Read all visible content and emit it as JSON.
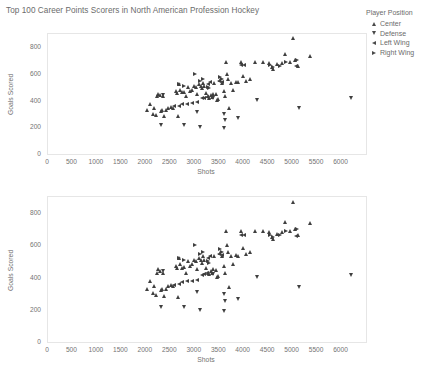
{
  "title": "Top 100 Career Points Scorers in North American Profession Hockey",
  "legend": {
    "title": "Player Position",
    "items": [
      {
        "label": "Center",
        "marker": "triangle-up-icon",
        "shape": "up"
      },
      {
        "label": "Defense",
        "marker": "triangle-down-icon",
        "shape": "down"
      },
      {
        "label": "Left Wing",
        "marker": "triangle-left-icon",
        "shape": "left"
      },
      {
        "label": "Right Wing",
        "marker": "triangle-right-icon",
        "shape": "right"
      }
    ]
  },
  "colors": {
    "marker": "#3f3f3f",
    "axis_text": "#737373",
    "frame": "#e6e6e6",
    "title_text": "#6b6b6b"
  },
  "chart_data": [
    {
      "type": "scatter",
      "title": "Top 100 Career Points Scorers in North American Profession Hockey",
      "xlabel": "Shots",
      "ylabel": "Goals Scored",
      "xlim": [
        0,
        6500
      ],
      "ylim": [
        0,
        900
      ],
      "xticks": [
        0,
        500,
        1000,
        1500,
        2000,
        2500,
        3000,
        3500,
        4000,
        4500,
        5000,
        5500,
        6000
      ],
      "yticks": [
        0,
        200,
        400,
        600,
        800
      ],
      "grid": false,
      "legend_position": "right",
      "series": [
        {
          "name": "Center",
          "marker": "triangle-up",
          "points": [
            [
              2030,
              325
            ],
            [
              2090,
              375
            ],
            [
              2150,
              300
            ],
            [
              2180,
              345
            ],
            [
              2210,
              290
            ],
            [
              2250,
              430
            ],
            [
              2270,
              450
            ],
            [
              2300,
              440
            ],
            [
              2330,
              320
            ],
            [
              2340,
              330
            ],
            [
              2360,
              430
            ],
            [
              2380,
              285
            ],
            [
              2420,
              325
            ],
            [
              2470,
              345
            ],
            [
              2520,
              350
            ],
            [
              2560,
              345
            ],
            [
              2620,
              470
            ],
            [
              2640,
              455
            ],
            [
              2660,
              280
            ],
            [
              2700,
              520
            ],
            [
              2720,
              480
            ],
            [
              2760,
              460
            ],
            [
              2800,
              465
            ],
            [
              2840,
              430
            ],
            [
              2880,
              500
            ],
            [
              2920,
              470
            ],
            [
              2960,
              480
            ],
            [
              3000,
              510
            ],
            [
              3040,
              500
            ],
            [
              3060,
              450
            ],
            [
              3100,
              520
            ],
            [
              3130,
              505
            ],
            [
              3160,
              490
            ],
            [
              3180,
              530
            ],
            [
              3200,
              510
            ],
            [
              3240,
              455
            ],
            [
              3280,
              430
            ],
            [
              3300,
              420
            ],
            [
              3340,
              440
            ],
            [
              3360,
              425
            ],
            [
              3380,
              450
            ],
            [
              3400,
              530
            ],
            [
              3440,
              445
            ],
            [
              3470,
              400
            ],
            [
              3490,
              410
            ],
            [
              3520,
              550
            ],
            [
              3560,
              530
            ],
            [
              3600,
              470
            ],
            [
              3620,
              430
            ],
            [
              3650,
              690
            ],
            [
              3680,
              600
            ],
            [
              3700,
              560
            ],
            [
              3720,
              340
            ],
            [
              3760,
              530
            ],
            [
              3800,
              480
            ],
            [
              3860,
              540
            ],
            [
              3900,
              535
            ],
            [
              3960,
              690
            ],
            [
              4000,
              580
            ],
            [
              4050,
              545
            ],
            [
              4150,
              560
            ],
            [
              4250,
              690
            ],
            [
              4400,
              690
            ],
            [
              4520,
              680
            ],
            [
              4600,
              650
            ],
            [
              4620,
              635
            ],
            [
              4700,
              670
            ],
            [
              4800,
              680
            ],
            [
              4860,
              745
            ],
            [
              4950,
              690
            ],
            [
              5020,
              870
            ],
            [
              5060,
              700
            ],
            [
              5120,
              660
            ],
            [
              5360,
              735
            ]
          ]
        },
        {
          "name": "Defense",
          "marker": "triangle-down",
          "points": [
            [
              2330,
              215
            ],
            [
              2360,
              440
            ],
            [
              2800,
              215
            ],
            [
              3060,
              310
            ],
            [
              3120,
              200
            ],
            [
              3380,
              420
            ],
            [
              3600,
              190
            ],
            [
              3610,
              295
            ],
            [
              3630,
              255
            ],
            [
              3900,
              265
            ],
            [
              4280,
              400
            ],
            [
              5150,
              340
            ],
            [
              6200,
              415
            ]
          ]
        },
        {
          "name": "Left Wing",
          "marker": "triangle-left",
          "points": [
            [
              2580,
              355
            ],
            [
              2680,
              360
            ],
            [
              2760,
              370
            ],
            [
              2860,
              375
            ],
            [
              2960,
              380
            ],
            [
              3060,
              385
            ],
            [
              3160,
              415
            ],
            [
              3200,
              420
            ],
            [
              3260,
              425
            ],
            [
              3280,
              520
            ],
            [
              3320,
              535
            ],
            [
              3500,
              545
            ],
            [
              3560,
              540
            ],
            [
              3960,
              665
            ],
            [
              4010,
              665
            ],
            [
              5080,
              655
            ]
          ]
        },
        {
          "name": "Right Wing",
          "marker": "triangle-right",
          "points": [
            [
              2680,
              520
            ],
            [
              2800,
              510
            ],
            [
              3010,
              600
            ],
            [
              3120,
              545
            ],
            [
              3180,
              560
            ],
            [
              3280,
              500
            ],
            [
              3300,
              490
            ],
            [
              3520,
              575
            ],
            [
              3560,
              560
            ],
            [
              4560,
              665
            ],
            [
              4620,
              650
            ],
            [
              4760,
              660
            ],
            [
              4880,
              690
            ],
            [
              5100,
              700
            ]
          ]
        }
      ]
    },
    {
      "type": "scatter",
      "title": "",
      "xlabel": "Shots",
      "ylabel": "Goals Scored",
      "xlim": [
        0,
        6500
      ],
      "ylim": [
        0,
        900
      ],
      "xticks": [
        0,
        500,
        1000,
        1500,
        2000,
        2500,
        3000,
        3500,
        4000,
        4500,
        5000,
        5500,
        6000
      ],
      "yticks": [
        0,
        200,
        400,
        600,
        800
      ],
      "grid": false,
      "legend_position": "none",
      "series": [
        {
          "name": "Center",
          "marker": "triangle-up",
          "points": [
            [
              2030,
              325
            ],
            [
              2090,
              375
            ],
            [
              2150,
              300
            ],
            [
              2180,
              345
            ],
            [
              2210,
              290
            ],
            [
              2250,
              430
            ],
            [
              2270,
              450
            ],
            [
              2300,
              440
            ],
            [
              2330,
              320
            ],
            [
              2340,
              330
            ],
            [
              2360,
              430
            ],
            [
              2380,
              285
            ],
            [
              2420,
              325
            ],
            [
              2470,
              345
            ],
            [
              2520,
              350
            ],
            [
              2560,
              345
            ],
            [
              2620,
              470
            ],
            [
              2640,
              455
            ],
            [
              2660,
              280
            ],
            [
              2700,
              520
            ],
            [
              2720,
              480
            ],
            [
              2760,
              460
            ],
            [
              2800,
              465
            ],
            [
              2840,
              430
            ],
            [
              2880,
              500
            ],
            [
              2920,
              470
            ],
            [
              2960,
              480
            ],
            [
              3000,
              510
            ],
            [
              3040,
              500
            ],
            [
              3060,
              450
            ],
            [
              3100,
              520
            ],
            [
              3130,
              505
            ],
            [
              3160,
              490
            ],
            [
              3180,
              530
            ],
            [
              3200,
              510
            ],
            [
              3240,
              455
            ],
            [
              3280,
              430
            ],
            [
              3300,
              420
            ],
            [
              3340,
              440
            ],
            [
              3360,
              425
            ],
            [
              3380,
              450
            ],
            [
              3400,
              530
            ],
            [
              3440,
              445
            ],
            [
              3470,
              400
            ],
            [
              3490,
              410
            ],
            [
              3520,
              550
            ],
            [
              3560,
              530
            ],
            [
              3600,
              470
            ],
            [
              3620,
              430
            ],
            [
              3650,
              690
            ],
            [
              3680,
              600
            ],
            [
              3700,
              560
            ],
            [
              3720,
              340
            ],
            [
              3760,
              530
            ],
            [
              3800,
              480
            ],
            [
              3860,
              540
            ],
            [
              3900,
              535
            ],
            [
              3960,
              690
            ],
            [
              4000,
              580
            ],
            [
              4050,
              545
            ],
            [
              4150,
              560
            ],
            [
              4250,
              690
            ],
            [
              4400,
              690
            ],
            [
              4520,
              680
            ],
            [
              4600,
              650
            ],
            [
              4620,
              635
            ],
            [
              4700,
              670
            ],
            [
              4800,
              680
            ],
            [
              4860,
              745
            ],
            [
              4950,
              690
            ],
            [
              5020,
              870
            ],
            [
              5060,
              700
            ],
            [
              5120,
              660
            ],
            [
              5360,
              735
            ]
          ]
        },
        {
          "name": "Defense",
          "marker": "triangle-down",
          "points": [
            [
              2330,
              215
            ],
            [
              2360,
              440
            ],
            [
              2800,
              215
            ],
            [
              3060,
              310
            ],
            [
              3120,
              200
            ],
            [
              3380,
              420
            ],
            [
              3600,
              190
            ],
            [
              3610,
              295
            ],
            [
              3630,
              255
            ],
            [
              3900,
              265
            ],
            [
              4280,
              400
            ],
            [
              5150,
              340
            ],
            [
              6200,
              415
            ]
          ]
        },
        {
          "name": "Left Wing",
          "marker": "triangle-left",
          "points": [
            [
              2580,
              355
            ],
            [
              2680,
              360
            ],
            [
              2760,
              370
            ],
            [
              2860,
              375
            ],
            [
              2960,
              380
            ],
            [
              3060,
              385
            ],
            [
              3160,
              415
            ],
            [
              3200,
              420
            ],
            [
              3260,
              425
            ],
            [
              3280,
              520
            ],
            [
              3320,
              535
            ],
            [
              3500,
              545
            ],
            [
              3560,
              540
            ],
            [
              3960,
              665
            ],
            [
              4010,
              665
            ],
            [
              5080,
              655
            ]
          ]
        },
        {
          "name": "Right Wing",
          "marker": "triangle-right",
          "points": [
            [
              2680,
              520
            ],
            [
              2800,
              510
            ],
            [
              3010,
              600
            ],
            [
              3120,
              545
            ],
            [
              3180,
              560
            ],
            [
              3280,
              500
            ],
            [
              3300,
              490
            ],
            [
              3520,
              575
            ],
            [
              3560,
              560
            ],
            [
              4560,
              665
            ],
            [
              4620,
              650
            ],
            [
              4760,
              660
            ],
            [
              4880,
              690
            ],
            [
              5100,
              700
            ]
          ]
        }
      ]
    }
  ],
  "panels": [
    {
      "frame": {
        "left": 47,
        "top": 33,
        "width": 318,
        "height": 120
      }
    },
    {
      "frame": {
        "left": 47,
        "top": 196,
        "width": 318,
        "height": 145
      }
    }
  ]
}
